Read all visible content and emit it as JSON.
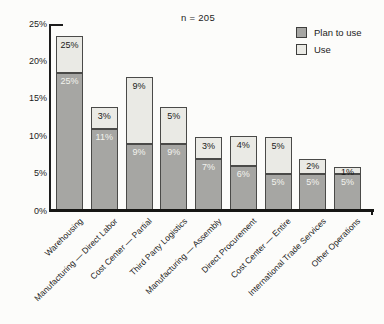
{
  "title": {
    "text": "n = 205"
  },
  "legend": {
    "items": [
      {
        "label": "Plan to use",
        "color": "#a6a6a3"
      },
      {
        "label": "Use",
        "color": "#eaeae5"
      }
    ]
  },
  "chart_data": {
    "type": "bar",
    "stacked": true,
    "title": "n = 205",
    "categories": [
      "Warehousing",
      "Manufacturing — Direct Labor",
      "Cost Center — Partial",
      "Third Party Logistics",
      "Manufacturing — Assembly",
      "Direct Procurement",
      "Cost Center — Entire",
      "International Trade Services",
      "Other Operations"
    ],
    "series": [
      {
        "name": "Plan to use",
        "color": "#a6a6a3",
        "label_color": "#f3f3ee",
        "values": [
          25,
          11,
          9,
          9,
          7,
          6,
          5,
          5,
          5
        ],
        "labels": [
          "25%",
          "11%",
          "9%",
          "9%",
          "7%",
          "6%",
          "5%",
          "5%",
          "5%"
        ],
        "drawn_heights": [
          18.5,
          11,
          9,
          9,
          7,
          6,
          5,
          5,
          5
        ]
      },
      {
        "name": "Use",
        "color": "#eaeae5",
        "label_color": "#1a1a1a",
        "values": [
          25,
          3,
          9,
          5,
          3,
          4,
          5,
          2,
          1
        ],
        "labels": [
          "25%",
          "3%",
          "9%",
          "5%",
          "3%",
          "4%",
          "5%",
          "2%",
          "1%"
        ],
        "drawn_heights": [
          5,
          3,
          9,
          5,
          3,
          4,
          5,
          2,
          1
        ]
      }
    ],
    "y_ticks": [
      {
        "label": "0%",
        "value": 0
      },
      {
        "label": "5%",
        "value": 5
      },
      {
        "label": "10%",
        "value": 10
      },
      {
        "label": "15%",
        "value": 15
      },
      {
        "label": "20%",
        "value": 20
      },
      {
        "label": "25%",
        "value": 25
      }
    ],
    "ylim": [
      0,
      25
    ],
    "legend_position": "top-right",
    "grid": false,
    "bar_border_color": "#4a4a48",
    "axis_color": "#1c1c1c"
  }
}
